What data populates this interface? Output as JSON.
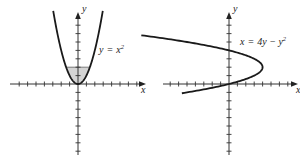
{
  "figures": [
    {
      "id": "left",
      "equation": {
        "lhs": "y",
        "op": "=",
        "rhs": "x",
        "exp": "2"
      },
      "x_axis_label": "x",
      "y_axis_label": "y",
      "curve": "y = x^2",
      "shaded_region": {
        "description": "region between y = x^2 and y = 2",
        "y_from": 0,
        "y_to": 2
      },
      "x_ticks": [
        -8,
        -7,
        -6,
        -5,
        -4,
        -3,
        -2,
        -1,
        1,
        2,
        3,
        4,
        5,
        6,
        7,
        8
      ],
      "y_ticks": [
        -8,
        -7,
        -6,
        -5,
        -4,
        -3,
        -2,
        -1,
        1,
        2,
        3,
        4,
        5,
        6,
        7,
        8
      ],
      "x_range": [
        -9,
        9
      ],
      "y_range": [
        -8.5,
        8.5
      ]
    },
    {
      "id": "right",
      "equation": {
        "lhs": "x",
        "op": "=",
        "rhs": "4y − y",
        "exp": "2"
      },
      "x_axis_label": "x",
      "y_axis_label": "y",
      "curve": "x = 4y - y^2",
      "x_ticks": [
        -8,
        -7,
        -6,
        -5,
        -4,
        -3,
        -2,
        -1,
        1,
        2,
        3,
        4,
        5,
        6,
        7,
        8
      ],
      "y_ticks": [
        -8,
        -7,
        -6,
        -5,
        -4,
        -3,
        -2,
        -1,
        1,
        2,
        3,
        4,
        5,
        6,
        7,
        8
      ],
      "x_range": [
        -9,
        9
      ],
      "y_range": [
        -8.5,
        8.5
      ]
    }
  ],
  "colors": {
    "ink": "#1a1a1a",
    "shade": "#d4d4d4",
    "axis": "#333333"
  }
}
